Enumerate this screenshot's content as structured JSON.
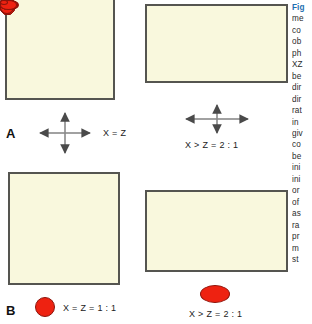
{
  "figure": {
    "background_color": "#ffffff",
    "panel_fill_color": "#f9f8dd",
    "panel_border_color": "#555550",
    "dark_particle_color": "#7d1c12",
    "bright_particle_color": "#ee2211",
    "caption_accent_color": "#1f6fb0"
  },
  "panels": {
    "a": {
      "letter": "A",
      "ratio_label": "X = Z",
      "particles": [
        {
          "cx": 24,
          "cy": 6,
          "rx": 3.6,
          "ry": 3.4
        },
        {
          "cx": 58,
          "cy": 6,
          "rx": 3.6,
          "ry": 3.4
        },
        {
          "cx": 94,
          "cy": 6,
          "rx": 3.6,
          "ry": 3.4
        },
        {
          "cx": 42,
          "cy": 25,
          "rx": 3.6,
          "ry": 3.4
        },
        {
          "cx": 78,
          "cy": 24,
          "rx": 3.6,
          "ry": 3.4
        },
        {
          "cx": 24,
          "cy": 43,
          "rx": 3.6,
          "ry": 3.4
        },
        {
          "cx": 59,
          "cy": 44,
          "rx": 3.6,
          "ry": 3.4
        },
        {
          "cx": 95,
          "cy": 43,
          "rx": 3.6,
          "ry": 3.4
        },
        {
          "cx": 42,
          "cy": 62,
          "rx": 3.6,
          "ry": 3.4
        },
        {
          "cx": 78,
          "cy": 62,
          "rx": 3.6,
          "ry": 3.4
        },
        {
          "cx": 24,
          "cy": 80,
          "rx": 3.6,
          "ry": 3.4
        },
        {
          "cx": 59,
          "cy": 80,
          "rx": 3.6,
          "ry": 3.4
        },
        {
          "cx": 95,
          "cy": 80,
          "rx": 3.6,
          "ry": 3.4
        }
      ]
    },
    "a2": {
      "ratio_label": "X > Z = 2 : 1",
      "particles": [
        {
          "cx": 25,
          "cy": 13,
          "rx": 5.0,
          "ry": 2.6
        },
        {
          "cx": 65,
          "cy": 12,
          "rx": 5.0,
          "ry": 2.6
        },
        {
          "cx": 112,
          "cy": 12,
          "rx": 5.0,
          "ry": 2.6
        },
        {
          "cx": 45,
          "cy": 29,
          "rx": 5.0,
          "ry": 2.6
        },
        {
          "cx": 90,
          "cy": 28,
          "rx": 5.0,
          "ry": 2.6
        },
        {
          "cx": 25,
          "cy": 41,
          "rx": 5.0,
          "ry": 2.6
        },
        {
          "cx": 67,
          "cy": 41,
          "rx": 5.0,
          "ry": 2.6
        },
        {
          "cx": 113,
          "cy": 41,
          "rx": 5.0,
          "ry": 2.6
        },
        {
          "cx": 47,
          "cy": 54,
          "rx": 5.0,
          "ry": 2.6
        },
        {
          "cx": 90,
          "cy": 54,
          "rx": 5.0,
          "ry": 2.6
        },
        {
          "cx": 25,
          "cy": 67,
          "rx": 5.0,
          "ry": 2.6
        },
        {
          "cx": 68,
          "cy": 67,
          "rx": 5.0,
          "ry": 2.6
        },
        {
          "cx": 113,
          "cy": 67,
          "rx": 5.0,
          "ry": 2.6
        }
      ]
    },
    "b": {
      "letter": "B",
      "ratio_label": "X = Z = 1 : 1",
      "particles": [
        {
          "cx": 21,
          "cy": 24,
          "rx": 5.0,
          "ry": 5.0
        },
        {
          "cx": 36,
          "cy": 13,
          "rx": 3.8,
          "ry": 3.8
        },
        {
          "cx": 53,
          "cy": 20,
          "rx": 7.6,
          "ry": 7.6
        },
        {
          "cx": 74,
          "cy": 26,
          "rx": 7.6,
          "ry": 7.6
        },
        {
          "cx": 91,
          "cy": 15,
          "rx": 4.4,
          "ry": 4.4
        },
        {
          "cx": 15,
          "cy": 42,
          "rx": 7.6,
          "ry": 7.6
        },
        {
          "cx": 40,
          "cy": 38,
          "rx": 5.0,
          "ry": 5.0
        },
        {
          "cx": 62,
          "cy": 47,
          "rx": 3.4,
          "ry": 3.4
        },
        {
          "cx": 97,
          "cy": 42,
          "rx": 7.6,
          "ry": 7.6
        },
        {
          "cx": 35,
          "cy": 62,
          "rx": 4.0,
          "ry": 4.0
        },
        {
          "cx": 56,
          "cy": 58,
          "rx": 7.3,
          "ry": 7.3
        },
        {
          "cx": 94,
          "cy": 62,
          "rx": 3.8,
          "ry": 3.8
        },
        {
          "cx": 69,
          "cy": 70,
          "rx": 4.0,
          "ry": 4.0
        },
        {
          "cx": 18,
          "cy": 76,
          "rx": 3.6,
          "ry": 3.6
        },
        {
          "cx": 51,
          "cy": 81,
          "rx": 4.6,
          "ry": 4.6
        },
        {
          "cx": 87,
          "cy": 82,
          "rx": 7.0,
          "ry": 7.0
        },
        {
          "cx": 30,
          "cy": 94,
          "rx": 7.0,
          "ry": 7.0
        },
        {
          "cx": 70,
          "cy": 99,
          "rx": 3.8,
          "ry": 3.8
        }
      ]
    },
    "b2": {
      "ratio_label": "X > Z = 2 : 1",
      "particles": [
        {
          "cx": 27,
          "cy": 17,
          "rx": 6.4,
          "ry": 3.6
        },
        {
          "cx": 49,
          "cy": 11,
          "rx": 4.6,
          "ry": 2.6
        },
        {
          "cx": 75,
          "cy": 16,
          "rx": 9.4,
          "ry": 5.2
        },
        {
          "cx": 103,
          "cy": 20,
          "rx": 8.8,
          "ry": 4.8
        },
        {
          "cx": 127,
          "cy": 12,
          "rx": 5.8,
          "ry": 3.2
        },
        {
          "cx": 18,
          "cy": 32,
          "rx": 9.0,
          "ry": 5.0
        },
        {
          "cx": 48,
          "cy": 30,
          "rx": 5.6,
          "ry": 3.2
        },
        {
          "cx": 86,
          "cy": 32,
          "rx": 4.0,
          "ry": 2.4
        },
        {
          "cx": 128,
          "cy": 32,
          "rx": 9.0,
          "ry": 5.0
        },
        {
          "cx": 40,
          "cy": 46,
          "rx": 4.2,
          "ry": 2.6
        },
        {
          "cx": 68,
          "cy": 44,
          "rx": 9.0,
          "ry": 5.0
        },
        {
          "cx": 119,
          "cy": 46,
          "rx": 4.2,
          "ry": 2.6
        },
        {
          "cx": 92,
          "cy": 55,
          "rx": 5.2,
          "ry": 3.0
        },
        {
          "cx": 15,
          "cy": 60,
          "rx": 4.4,
          "ry": 2.6
        },
        {
          "cx": 62,
          "cy": 62,
          "rx": 5.6,
          "ry": 3.2
        },
        {
          "cx": 122,
          "cy": 62,
          "rx": 8.8,
          "ry": 4.8
        },
        {
          "cx": 33,
          "cy": 71,
          "rx": 8.6,
          "ry": 4.8
        },
        {
          "cx": 90,
          "cy": 71,
          "rx": 4.2,
          "ry": 2.6
        }
      ]
    }
  },
  "legends": {
    "b_shape": {
      "width": 18,
      "height": 18
    },
    "b2_shape": {
      "width": 28,
      "height": 16
    }
  },
  "caption": {
    "lines": [
      "Fig",
      "me",
      "co",
      "ob",
      "ph",
      "XZ",
      "be",
      "dir",
      "dir",
      "rat",
      "in",
      "giv",
      "co",
      "be",
      "ini",
      "ini",
      "or",
      "of",
      "as",
      "ra",
      "pr",
      "m",
      "st"
    ]
  }
}
